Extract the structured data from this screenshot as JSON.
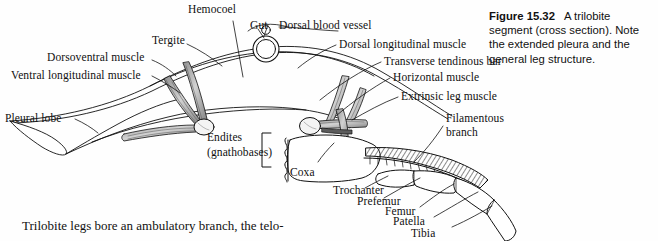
{
  "figure": {
    "caption_number": "Figure 15.32",
    "caption_text": "A trilobite segment (cross section). Note the extended pleura and the general leg structure."
  },
  "body_text": "Trilobite legs bore an ambulatory branch, the telo-",
  "labels": {
    "hemocoel": "Hemocoel",
    "gut": "Gut",
    "dorsal_blood_vessel": "Dorsal blood vessel",
    "tergite": "Tergite",
    "dorsoventral_muscle": "Dorsoventral muscle",
    "ventral_longitudinal_muscle": "Ventral longitudinal muscle",
    "pleural_lobe": "Pleural lobe",
    "dorsal_longitudinal_muscle": "Dorsal longitudinal muscle",
    "transverse_tendinous_bar": "Transverse tendinous bar",
    "horizontal_muscle": "Horizontal muscle",
    "extrinsic_leg_muscle": "Extrinsic leg muscle",
    "filamentous_branch_line1": "Filamentous",
    "filamentous_branch_line2": "branch",
    "endites_line1": "Endites",
    "endites_line2": "(gnathobases)",
    "coxa": "Coxa",
    "trochanter": "Trochanter",
    "prefemur": "Prefemur",
    "femur": "Femur",
    "patella": "Patella",
    "tibia": "Tibia"
  },
  "colors": {
    "ink": "#111111",
    "background": "#fefefe",
    "muscle_fill": "#b9b9b9",
    "apodeme_fill": "#efefef"
  }
}
